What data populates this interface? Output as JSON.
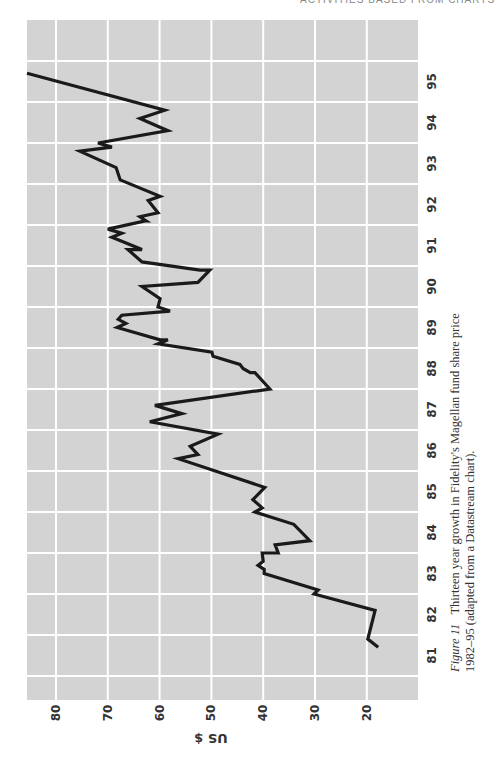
{
  "page": {
    "running_head": "ACTIVITIES BASED FROM CHARTS"
  },
  "caption": {
    "label": "Figure 11",
    "line1": "Thirteen year growth in Fidelity's Magellan fund share price",
    "line2": "1982–95 (adapted from a Datastream chart)."
  },
  "colors": {
    "plot_background": "#d3d3d3",
    "gridline": "#ffffff",
    "series_line": "#1a1a1a",
    "text": "#333333"
  },
  "chart_data": {
    "type": "line",
    "xlabel": "",
    "ylabel": "US $",
    "orientation": "rotated 90° counter-clockwise on page",
    "x_tick_labels": [
      "81",
      "82",
      "83",
      "84",
      "85",
      "86",
      "87",
      "88",
      "89",
      "90",
      "91",
      "92",
      "93",
      "94",
      "95"
    ],
    "y_ticks": [
      20,
      30,
      40,
      50,
      60,
      70,
      80
    ],
    "y_tick_labels": [
      "20",
      "30",
      "40",
      "50",
      "60",
      "70",
      "80"
    ],
    "xlim": [
      81,
      96
    ],
    "ylim": [
      10,
      86
    ],
    "grid": true,
    "legend": null,
    "series": [
      {
        "name": "Magellan fund share price",
        "x": [
          81.7,
          81.9,
          82.6,
          83.0,
          83.1,
          83.5,
          83.6,
          83.7,
          83.8,
          84.0,
          84.0,
          84.2,
          84.3,
          84.7,
          85.0,
          85.1,
          85.3,
          85.6,
          86.3,
          86.4,
          86.6,
          86.9,
          87.2,
          87.4,
          87.6,
          88.0,
          88.4,
          88.4,
          88.5,
          88.6,
          88.8,
          88.9,
          89.1,
          89.2,
          89.2,
          89.5,
          89.6,
          89.7,
          89.8,
          89.9,
          90.0,
          90.2,
          90.5,
          90.6,
          90.9,
          90.9,
          91.1,
          91.4,
          91.4,
          91.7,
          91.8,
          91.9,
          92.1,
          92.1,
          92.2,
          92.3,
          92.6,
          92.7,
          93.1,
          93.4,
          93.8,
          93.9,
          94.0,
          94.3,
          94.6,
          94.8,
          95.7
        ],
        "values": [
          17.8,
          19.8,
          18.4,
          30.2,
          29.4,
          39.8,
          39.8,
          41.0,
          40.0,
          40.2,
          37.1,
          37.7,
          31.0,
          34.1,
          41.6,
          40.2,
          42.0,
          39.7,
          56.4,
          52.6,
          54.1,
          48.7,
          61.9,
          55.7,
          60.9,
          38.7,
          41.6,
          42.5,
          43.9,
          44.5,
          49.7,
          49.9,
          60.3,
          58.4,
          59.9,
          68.2,
          66.5,
          68.0,
          67.3,
          58.0,
          60.3,
          59.9,
          63.4,
          52.6,
          50.3,
          52.2,
          63.4,
          66.1,
          63.4,
          69.2,
          67.3,
          70.0,
          62.8,
          62.6,
          63.8,
          60.3,
          62.2,
          59.9,
          67.6,
          68.4,
          75.4,
          69.2,
          71.9,
          58.4,
          63.8,
          59.0,
          85.6
        ]
      }
    ]
  }
}
